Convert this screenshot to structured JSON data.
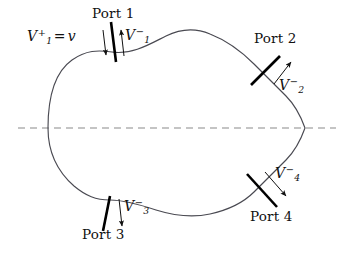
{
  "figure": {
    "type": "network-port-diagram",
    "title_visible": false,
    "canvas": {
      "width": 348,
      "height": 257
    },
    "colors": {
      "background": "#ffffff",
      "outline": "#3f3f46",
      "axis": "#8a8a8a",
      "port_line": "#000000",
      "arrow": "#111111",
      "text": "#111111"
    },
    "symmetry_axis": {
      "name": "horizontal-dashed-axis",
      "y": 128,
      "x_start": 18,
      "x_end": 336,
      "style": "dashed"
    },
    "body": {
      "name": "scatterer-outline",
      "description": "closed irregular blob with a cusp at right, symmetric about the dashed axis"
    },
    "ports": [
      {
        "id": "port1",
        "label": "Port 1",
        "incident_label": "V",
        "incident_sub": "1",
        "incident_sup": "+",
        "incident_equals": "=",
        "incident_value": "v",
        "reflected_label": "V",
        "reflected_sub": "1",
        "reflected_sup": "−",
        "has_incident_arrow": true,
        "has_reflected_arrow": true
      },
      {
        "id": "port2",
        "label": "Port 2",
        "reflected_label": "V",
        "reflected_sub": "2",
        "reflected_sup": "−",
        "has_incident_arrow": false,
        "has_reflected_arrow": true
      },
      {
        "id": "port3",
        "label": "Port 3",
        "reflected_label": "V",
        "reflected_sub": "3",
        "reflected_sup": "−",
        "has_incident_arrow": false,
        "has_reflected_arrow": true
      },
      {
        "id": "port4",
        "label": "Port 4",
        "reflected_label": "V",
        "reflected_sub": "4",
        "reflected_sup": "−",
        "has_incident_arrow": false,
        "has_reflected_arrow": true
      }
    ]
  }
}
